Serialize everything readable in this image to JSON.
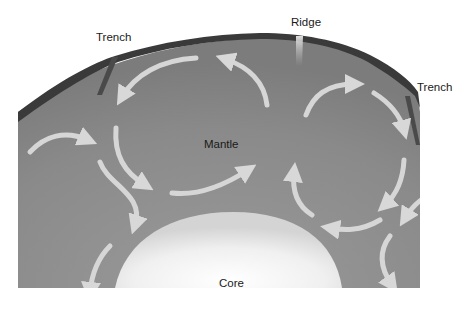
{
  "diagram": {
    "labels": {
      "trench_left": "Trench",
      "ridge": "Ridge",
      "trench_right": "Trench",
      "mantle": "Mantle",
      "core": "Core"
    },
    "colors": {
      "crust": "#3a3a3a",
      "mantle": "#8e8e8e",
      "core": "#f2f2f2",
      "arrow": "#d8d8d8",
      "background": "#ffffff"
    }
  }
}
